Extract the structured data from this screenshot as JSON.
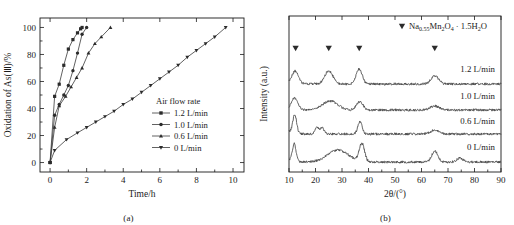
{
  "figure": {
    "panel_a_caption": "(a)",
    "panel_b_caption": "(b)"
  },
  "chart_data": [
    {
      "type": "line",
      "panel": "a",
      "title": "",
      "xlabel": "Time/h",
      "ylabel": "Oxidation of As(Ⅲ)/%",
      "xlim": [
        -0.55,
        10.6
      ],
      "ylim": [
        -7,
        107
      ],
      "xticks": [
        0,
        2,
        4,
        6,
        8,
        10
      ],
      "yticks": [
        0,
        20,
        40,
        60,
        80,
        100
      ],
      "xtick_labels": [
        "0",
        "2",
        "4",
        "6",
        "8",
        "10"
      ],
      "ytick_labels": [
        "0",
        "20",
        "40",
        "60",
        "80",
        "100"
      ],
      "grid": false,
      "legend_position": "right-middle",
      "legend_title": "Air flow rate",
      "series": [
        {
          "name": "1.2 L/min",
          "marker": "square",
          "x": [
            0.0,
            0.25,
            0.5,
            0.75,
            1.0,
            1.25,
            1.5,
            1.67,
            1.75
          ],
          "values": [
            0,
            49,
            58,
            72,
            84,
            91,
            96,
            99,
            100
          ]
        },
        {
          "name": "1.0 L/min",
          "marker": "circle",
          "x": [
            0.0,
            0.25,
            0.5,
            0.75,
            1.0,
            1.25,
            1.5,
            1.75,
            2.0
          ],
          "values": [
            0,
            35,
            43,
            50,
            57,
            68,
            81,
            95,
            100
          ]
        },
        {
          "name": "0.6 L/min",
          "marker": "triangle-up",
          "x": [
            0.0,
            0.25,
            0.5,
            0.85,
            1.15,
            1.45,
            1.75,
            2.1,
            2.45,
            2.8,
            3.3
          ],
          "values": [
            0,
            26,
            42,
            49,
            56,
            63,
            70,
            81,
            88,
            93,
            100
          ]
        },
        {
          "name": "0 L/min",
          "marker": "triangle-down",
          "x": [
            0.0,
            0.25,
            0.9,
            1.5,
            2.0,
            2.5,
            3.0,
            3.5,
            4.0,
            4.5,
            5.0,
            5.5,
            6.0,
            6.5,
            7.0,
            7.5,
            8.0,
            8.5,
            9.0,
            9.6
          ],
          "values": [
            0,
            9,
            17,
            22,
            26,
            30,
            34,
            38,
            43,
            47,
            52,
            57,
            62,
            67,
            72,
            78,
            83,
            88,
            93,
            100
          ]
        }
      ]
    },
    {
      "type": "line",
      "panel": "b",
      "title": "",
      "xlabel": "2θ/(°)",
      "ylabel": "Intensity (a.u.)",
      "xlim": [
        10,
        90
      ],
      "xticks": [
        10,
        20,
        30,
        40,
        50,
        60,
        70,
        80,
        90
      ],
      "xtick_labels": [
        "10",
        "20",
        "30",
        "40",
        "50",
        "60",
        "70",
        "80",
        "90"
      ],
      "yticks": [],
      "ytick_labels": [],
      "grid": false,
      "annotation": {
        "marker": "triangle-down-filled",
        "formula_main": "Na",
        "formula_sub1": "0.55",
        "formula_mid": "Mn",
        "formula_sub2": "2",
        "formula_o": "O",
        "formula_sub3": "4",
        "formula_dot": " · 1.5H",
        "formula_sub4": "2",
        "formula_end": "O"
      },
      "peak_markers_2theta": [
        12.5,
        25.0,
        36.5,
        65.0
      ],
      "traces": [
        {
          "name": "1.2 L/min",
          "label": "1.2 L/min",
          "peaks": [
            {
              "pos": 12.5,
              "height": 11,
              "width": 1.6
            },
            {
              "pos": 25.0,
              "height": 13,
              "width": 2.2
            },
            {
              "pos": 36.5,
              "height": 15,
              "width": 1.6
            },
            {
              "pos": 65.0,
              "height": 8,
              "width": 2.0
            }
          ],
          "baseline": 0
        },
        {
          "name": "1.0 L/min",
          "label": "1.0 L/min",
          "peaks": [
            {
              "pos": 12.3,
              "height": 10,
              "width": 1.5
            },
            {
              "pos": 25.5,
              "height": 9,
              "width": 4.0
            },
            {
              "pos": 36.7,
              "height": 8,
              "width": 1.8
            },
            {
              "pos": 65.0,
              "height": 4,
              "width": 2.4
            }
          ],
          "baseline": 0
        },
        {
          "name": "0.6 L/min",
          "label": "0.6 L/min",
          "peaks": [
            {
              "pos": 12.2,
              "height": 17,
              "width": 1.0
            },
            {
              "pos": 20.5,
              "height": 7,
              "width": 1.0
            },
            {
              "pos": 22.5,
              "height": 6,
              "width": 1.0
            },
            {
              "pos": 36.8,
              "height": 12,
              "width": 1.2
            },
            {
              "pos": 65.0,
              "height": 4,
              "width": 2.2
            }
          ],
          "baseline": 0
        },
        {
          "name": "0 L/min",
          "label": "0 L/min",
          "peaks": [
            {
              "pos": 12.0,
              "height": 16,
              "width": 0.9
            },
            {
              "pos": 28.5,
              "height": 12,
              "width": 5.5
            },
            {
              "pos": 37.5,
              "height": 18,
              "width": 1.4
            },
            {
              "pos": 65.0,
              "height": 11,
              "width": 1.6
            },
            {
              "pos": 74.5,
              "height": 4,
              "width": 1.6
            }
          ],
          "baseline": 0
        }
      ]
    }
  ]
}
